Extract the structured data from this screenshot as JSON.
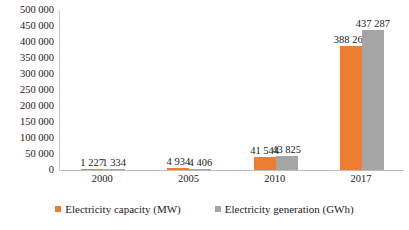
{
  "chart_data": {
    "type": "bar",
    "title": "",
    "subtitle": "",
    "xlabel": "",
    "ylabel": "",
    "categories": [
      "2000",
      "2005",
      "2010",
      "2017"
    ],
    "series": [
      {
        "name": "Electricity capacity (MW)",
        "color": "#ED7D31",
        "values": [
          1227,
          4934,
          41544,
          388268
        ],
        "labels": [
          "1 227",
          "4 934",
          "41 544",
          "388 268"
        ]
      },
      {
        "name": "Electricity generation (GWh)",
        "color": "#A5A5A5",
        "values": [
          1334,
          4406,
          43825,
          437287
        ],
        "labels": [
          "1 334",
          "4 406",
          "43 825",
          "437 287"
        ]
      }
    ],
    "ylim": [
      0,
      500000
    ],
    "ytick_step": 50000,
    "ytick_labels": [
      "500 000",
      "450 000",
      "400 000",
      "350 000",
      "300 000",
      "250 000",
      "200 000",
      "150 000",
      "100 000",
      "50 000",
      "0"
    ],
    "ytick_values": [
      500000,
      450000,
      400000,
      350000,
      300000,
      250000,
      200000,
      150000,
      100000,
      50000,
      0
    ],
    "grid": false,
    "legend_position": "bottom"
  },
  "legend": {
    "items": [
      {
        "label": "Electricity capacity (MW)",
        "color": "#ED7D31"
      },
      {
        "label": "Electricity generation (GWh)",
        "color": "#A5A5A5"
      }
    ]
  },
  "colors": {
    "capacity": "#ED7D31",
    "generation": "#A5A5A5",
    "axis": "#bdbdbd",
    "text": "#1a1a1a",
    "background": "#ffffff"
  }
}
